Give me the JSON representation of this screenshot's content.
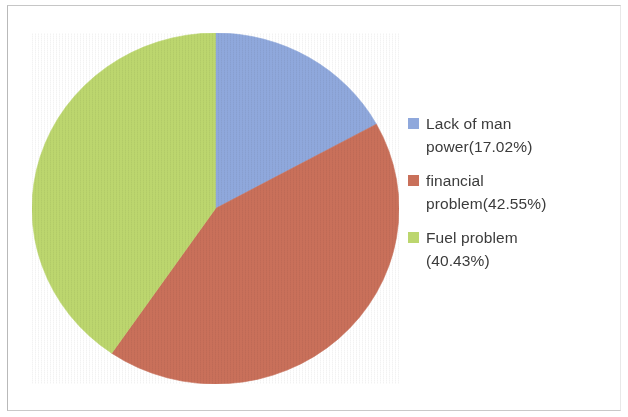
{
  "chart_data": {
    "type": "pie",
    "title": "",
    "subtitle": "",
    "xlabel": "",
    "ylabel": "",
    "grid": false,
    "legend_position": "right",
    "start_angle_deg": 0,
    "direction": "clockwise",
    "categories": [
      "Lack of man power",
      "financial problem",
      "Fuel problem"
    ],
    "values": [
      17.02,
      42.55,
      40.43
    ],
    "value_unit": "%",
    "colors": [
      "#8fa8dc",
      "#c9705a",
      "#bcd66e"
    ],
    "slices": [
      {
        "label": "Lack of man power",
        "value": 17.02,
        "display": "17.02%",
        "color": "#8fa8dc",
        "angle_deg": 61.27
      },
      {
        "label": "financial problem",
        "value": 42.55,
        "display": "42.55%",
        "color": "#c9705a",
        "angle_deg": 153.18
      },
      {
        "label": "Fuel problem",
        "value": 40.43,
        "display": "40.43%",
        "color": "#bcd66e",
        "angle_deg": 145.55
      }
    ],
    "legend_entries": [
      {
        "swatch_color": "#8fa8dc",
        "text": "Lack of man\npower(17.02%)"
      },
      {
        "swatch_color": "#c9705a",
        "text": "financial\nproblem(42.55%)"
      },
      {
        "swatch_color": "#bcd66e",
        "text": "Fuel problem\n(40.43%)"
      }
    ]
  },
  "legend": {
    "items": [
      {
        "label": "Lack of man\npower(17.02%)",
        "color": "#8fa8dc"
      },
      {
        "label": "financial\nproblem(42.55%)",
        "color": "#c9705a"
      },
      {
        "label": "Fuel problem\n(40.43%)",
        "color": "#bcd66e"
      }
    ]
  },
  "colors": {
    "slice_blue": "#8fa8dc",
    "slice_red": "#c9705a",
    "slice_green": "#bcd66e",
    "background": "#ffffff",
    "frame": "#c2c2c2",
    "text": "#3b3b3b"
  }
}
